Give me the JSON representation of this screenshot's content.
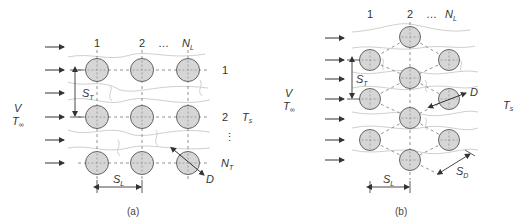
{
  "panel_a": {
    "caption": "(a)",
    "arrangement": "aligned",
    "column_labels": [
      "1",
      "2",
      "…",
      "N",
      "L"
    ],
    "row_labels": [
      "1",
      "2",
      "⋮",
      "N",
      "T"
    ],
    "inlet_V": "V",
    "inlet_T": "T",
    "inlet_T_sub": "∞",
    "outlet_T": "T",
    "outlet_T_sub": "s",
    "transverse_pitch": "S",
    "transverse_pitch_sub": "T",
    "longitudinal_pitch": "S",
    "longitudinal_pitch_sub": "L",
    "diameter": "D"
  },
  "panel_b": {
    "caption": "(b)",
    "arrangement": "staggered",
    "column_labels": [
      "1",
      "2",
      "…",
      "N",
      "L"
    ],
    "inlet_V": "V",
    "inlet_T": "T",
    "inlet_T_sub": "∞",
    "outlet_T": "T",
    "outlet_T_sub": "s",
    "transverse_pitch": "S",
    "transverse_pitch_sub": "T",
    "longitudinal_pitch": "S",
    "longitudinal_pitch_sub": "L",
    "diagonal_pitch": "S",
    "diagonal_pitch_sub": "D",
    "diameter": "D"
  },
  "colors": {
    "tube_fill": "#d6d6d6",
    "tube_stroke": "#555555",
    "line": "#333333",
    "streamline": "#c8c8c8",
    "dashed": "#666666"
  }
}
